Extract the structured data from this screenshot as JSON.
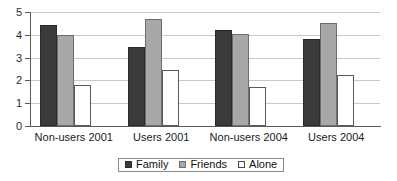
{
  "chart_data": {
    "type": "bar",
    "title": "",
    "subtitle": "",
    "xlabel": "",
    "ylabel": "",
    "categories": [
      "Non-users 2001",
      "Users 2001",
      "Non-users 2004",
      "Users 2004"
    ],
    "series": [
      {
        "name": "Family",
        "values": [
          4.45,
          3.45,
          4.2,
          3.8
        ],
        "color": "#3a3a3a"
      },
      {
        "name": "Friends",
        "values": [
          4.0,
          4.7,
          4.05,
          4.5
        ],
        "color": "#a8a8a8"
      },
      {
        "name": "Alone",
        "values": [
          1.8,
          2.45,
          1.7,
          2.25
        ],
        "color": "#ffffff"
      }
    ],
    "ylim": [
      0,
      5
    ],
    "ytick_labels": [
      "0",
      "1",
      "2",
      "3",
      "4",
      "5"
    ],
    "ytick_values": [
      0,
      1,
      2,
      3,
      4,
      5
    ],
    "grid": true,
    "grid_axis": "y",
    "legend_position": "bottom",
    "legend_entries": [
      "Family",
      "Friends",
      "Alone"
    ]
  },
  "axis": {
    "y_tick_0": "0",
    "y_tick_1": "1",
    "y_tick_2": "2",
    "y_tick_3": "3",
    "y_tick_4": "4",
    "y_tick_5": "5"
  },
  "categories": {
    "c0": "Non-users 2001",
    "c1": "Users 2001",
    "c2": "Non-users 2004",
    "c3": "Users 2004"
  },
  "legend": {
    "family": "Family",
    "friends": "Friends",
    "alone": "Alone"
  }
}
